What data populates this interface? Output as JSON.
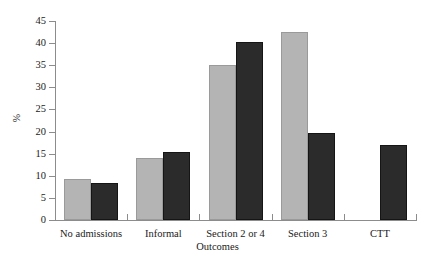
{
  "chart_data": {
    "type": "bar",
    "title": "",
    "xlabel": "Outcomes",
    "ylabel": "%",
    "categories": [
      "No admissions",
      "Informal",
      "Section 2 or 4",
      "Section 3",
      "CTT"
    ],
    "series": [
      {
        "name": "light",
        "color": "#b4b4b4",
        "values": [
          9.3,
          14.0,
          35.0,
          42.5,
          0
        ]
      },
      {
        "name": "dark",
        "color": "#2b2b2b",
        "values": [
          8.4,
          15.3,
          40.2,
          19.7,
          17.0
        ]
      }
    ],
    "ylim": [
      0,
      45
    ],
    "ytick_labels": [
      "0",
      "5",
      "10",
      "15",
      "20",
      "25",
      "30",
      "35",
      "40",
      "45"
    ],
    "ytick_values": [
      0,
      5,
      10,
      15,
      20,
      25,
      30,
      35,
      40,
      45
    ],
    "grid": false,
    "legend": "none"
  },
  "axes": {
    "axis_color": "#8c8c8c"
  }
}
